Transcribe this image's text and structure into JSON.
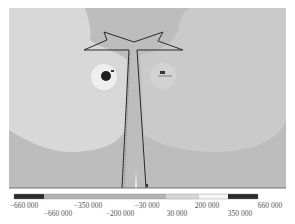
{
  "figure": {
    "type": "stress-contour-plot"
  },
  "colors": {
    "background_left_zone": "#d9d9d9",
    "background_right_zone": "#c9c9c9",
    "base_field": "#b8b8b8",
    "hole_light_ring": "#f1f1f1",
    "hole_dark_core": "#1e1e1e",
    "right_blob": "#d2d2d2",
    "outline": "#2a2a2a",
    "legend_dark": "#2b2b2b",
    "legend_mid": "#b3b3b3",
    "legend_light": "#d6d6d6",
    "legend_lighter": "#e6e6e6",
    "legend_white": "#f7f7f7"
  },
  "markers": {
    "left_hole_label": "K",
    "right_hole_label": "B",
    "stem_label": "E"
  },
  "legend": {
    "segments": [
      {
        "from": -660000,
        "to": -660000,
        "color": "#2b2b2b"
      },
      {
        "from": -660000,
        "to": -350000,
        "color": "#b3b3b3"
      },
      {
        "from": -350000,
        "to": -200000,
        "color": "#b3b3b3"
      },
      {
        "from": -200000,
        "to": -30000,
        "color": "#b3b3b3"
      },
      {
        "from": -30000,
        "to": 30000,
        "color": "#d6d6d6"
      },
      {
        "from": 30000,
        "to": 200000,
        "color": "#e6e6e6"
      },
      {
        "from": 200000,
        "to": 350000,
        "color": "#f7f7f7"
      },
      {
        "from": 350000,
        "to": 660000,
        "color": "#2b2b2b"
      }
    ],
    "top_labels": [
      "−660 000",
      "−350 000",
      "−30 000",
      "200 000",
      "660 000"
    ],
    "bottom_labels": [
      "−660 000",
      "−200 000",
      "30 000",
      "350 000"
    ]
  }
}
